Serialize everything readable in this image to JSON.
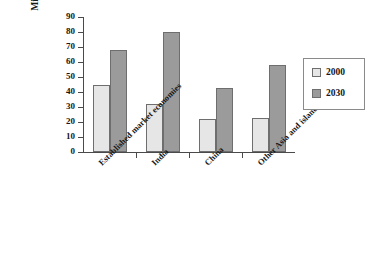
{
  "chart_data": {
    "type": "bar",
    "title": "",
    "xlabel": "",
    "ylabel": "Millions with diabetes",
    "ylim": [
      0,
      90
    ],
    "yticks": [
      0,
      10,
      20,
      30,
      40,
      50,
      60,
      70,
      80,
      90
    ],
    "grid": false,
    "legend_position": "right",
    "categories": [
      "Established market economies",
      "India",
      "China",
      "Other Asia and islands"
    ],
    "series": [
      {
        "name": "2000",
        "color": "#e6e6e6",
        "values": [
          45,
          32,
          22,
          23
        ]
      },
      {
        "name": "2030",
        "color": "#9b9b9b",
        "values": [
          68,
          80,
          43,
          58
        ]
      }
    ]
  },
  "legend": {
    "items": [
      {
        "label": "2000"
      },
      {
        "label": "2030"
      }
    ]
  },
  "axis": {
    "y_title": "Millions with diabetes",
    "tick_labels": [
      "90",
      "80",
      "70",
      "60",
      "50",
      "40",
      "30",
      "20",
      "10",
      "0"
    ]
  }
}
